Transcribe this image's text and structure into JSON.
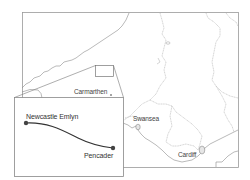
{
  "map": {
    "region": "South Wales",
    "frame_color": "#9a9a9a",
    "border_color": "#a8a8a8",
    "coast_color": "#8c8c8c",
    "route_color": "#333333",
    "places": [
      {
        "name": "Carmarthen",
        "x": 75,
        "y": 87
      },
      {
        "name": "Swansea",
        "x": 133,
        "y": 115
      },
      {
        "name": "Cardiff",
        "x": 178,
        "y": 152
      }
    ]
  },
  "inset": {
    "title": "Route detail",
    "start": {
      "name": "Newcastle Emlyn"
    },
    "end": {
      "name": "Pencader"
    }
  }
}
